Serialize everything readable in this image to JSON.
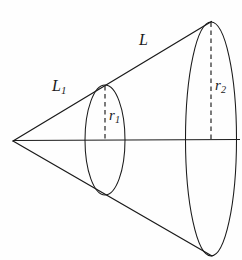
{
  "figure": {
    "name": "cone-frustum-diagram",
    "background_color": "#fefefe",
    "stroke_color": "#1a1a1a",
    "caption_remnant": "",
    "labels": {
      "slant_full": {
        "text": "L",
        "subscript": ""
      },
      "slant_partial": {
        "text": "L",
        "subscript": "1"
      },
      "radius_small": {
        "text": "r",
        "subscript": "1"
      },
      "radius_large": {
        "text": "r",
        "subscript": "2"
      }
    },
    "geometry": {
      "apex": {
        "x": 13,
        "y": 141
      },
      "axis_line": {
        "x1": 13,
        "y1": 140,
        "x2": 240,
        "y2": 139
      },
      "small_ellipse": {
        "cx": 105,
        "cy": 140,
        "rx": 20,
        "ry": 55
      },
      "large_ellipse": {
        "cx": 211,
        "cy": 139,
        "rx": 25.5,
        "ry": 117
      },
      "upper_slant": {
        "x1": 13,
        "y1": 141,
        "x2": 211,
        "y2": 22
      },
      "lower_slant": {
        "x1": 13,
        "y1": 141,
        "x2": 212,
        "y2": 256
      },
      "radius_small_dash": {
        "x": 105,
        "y1": 86,
        "y2": 140
      },
      "radius_large_dash": {
        "x": 211,
        "y1": 22,
        "y2": 139
      }
    }
  }
}
